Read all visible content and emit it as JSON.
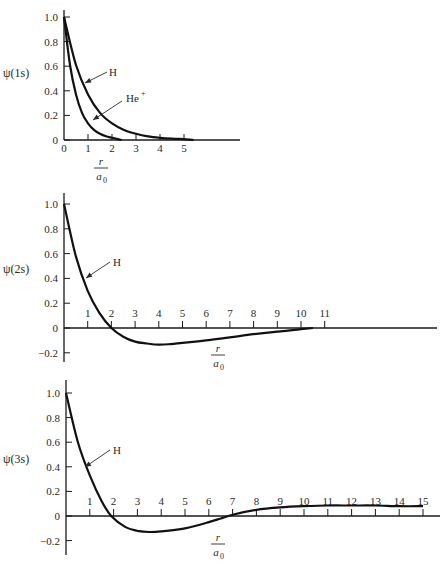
{
  "chart_data": [
    {
      "type": "line",
      "title": "",
      "xlabel": "r/a0",
      "ylabel": "ψ(1s)",
      "xlim": [
        0,
        7.3
      ],
      "ylim": [
        0,
        1.0
      ],
      "x_ticks": [
        "0",
        "1",
        "2",
        "3",
        "4",
        "5"
      ],
      "y_ticks": [
        "0",
        "0.2",
        "0.4",
        "0.6",
        "0.8",
        "1.0"
      ],
      "grid": false,
      "series": [
        {
          "name": "H",
          "x": [
            0,
            0.5,
            1,
            1.5,
            2,
            2.5,
            3,
            3.5,
            4,
            4.5,
            5,
            5.4
          ],
          "values": [
            1.0,
            0.61,
            0.37,
            0.22,
            0.135,
            0.082,
            0.05,
            0.03,
            0.018,
            0.011,
            0.007,
            0.0
          ]
        },
        {
          "name": "He+",
          "x": [
            0,
            0.25,
            0.5,
            0.75,
            1,
            1.25,
            1.5,
            1.75,
            2,
            2.4
          ],
          "values": [
            1.0,
            0.61,
            0.37,
            0.22,
            0.135,
            0.082,
            0.05,
            0.03,
            0.018,
            0.0
          ]
        }
      ],
      "annotations": [
        {
          "text": "H",
          "points_to": [
            1.6,
            0.4
          ]
        },
        {
          "text": "He+",
          "points_to": [
            1.0,
            0.2
          ]
        }
      ]
    },
    {
      "type": "line",
      "title": "",
      "xlabel": "r/a0",
      "ylabel": "ψ(2s)",
      "xlim": [
        0,
        14.5
      ],
      "ylim": [
        -0.2,
        1.0
      ],
      "x_ticks": [
        "1",
        "2",
        "3",
        "4",
        "5",
        "6",
        "7",
        "8",
        "9",
        "10",
        "11"
      ],
      "y_ticks": [
        "-0.2",
        "0",
        "0.2",
        "0.4",
        "0.6",
        "0.8",
        "1.0"
      ],
      "grid": false,
      "series": [
        {
          "name": "H",
          "x": [
            0,
            0.5,
            1,
            1.5,
            2,
            2.5,
            3,
            3.5,
            4,
            4.5,
            5,
            6,
            7,
            8,
            9,
            10,
            10.5
          ],
          "values": [
            1.0,
            0.58,
            0.3,
            0.12,
            0.0,
            -0.07,
            -0.11,
            -0.125,
            -0.135,
            -0.13,
            -0.12,
            -0.1,
            -0.075,
            -0.05,
            -0.03,
            -0.01,
            0.0
          ]
        }
      ],
      "annotations": [
        {
          "text": "H",
          "points_to": [
            0.9,
            0.35
          ]
        }
      ]
    },
    {
      "type": "line",
      "title": "",
      "xlabel": "r/a0",
      "ylabel": "ψ(3s)",
      "xlim": [
        0,
        15.7
      ],
      "ylim": [
        -0.2,
        1.0
      ],
      "x_ticks": [
        "1",
        "2",
        "3",
        "4",
        "5",
        "6",
        "7",
        "8",
        "9",
        "10",
        "11",
        "12",
        "13",
        "14",
        "15"
      ],
      "y_ticks": [
        "-0.2",
        "0",
        "0.2",
        "0.4",
        "0.6",
        "0.8",
        "1.0"
      ],
      "grid": false,
      "series": [
        {
          "name": "H",
          "x": [
            0,
            0.5,
            1,
            1.5,
            1.9,
            2.5,
            3,
            3.5,
            4,
            5,
            6,
            6.5,
            7,
            8,
            9,
            10,
            11,
            12,
            13,
            14,
            15
          ],
          "values": [
            1.0,
            0.6,
            0.33,
            0.12,
            0.0,
            -0.09,
            -0.12,
            -0.13,
            -0.125,
            -0.1,
            -0.05,
            -0.02,
            0.01,
            0.05,
            0.07,
            0.08,
            0.085,
            0.085,
            0.085,
            0.08,
            0.08
          ]
        }
      ],
      "annotations": [
        {
          "text": "H",
          "points_to": [
            0.85,
            0.4
          ]
        }
      ]
    }
  ],
  "labels": {
    "c1_ylabel": "ψ(1s)",
    "c2_ylabel": "ψ(2s)",
    "c3_ylabel": "ψ(3s)",
    "x_num": "r",
    "x_den": "a",
    "x_den_sub": "0",
    "ann_h": "H",
    "ann_he": "He",
    "ann_he_sup": "+"
  }
}
